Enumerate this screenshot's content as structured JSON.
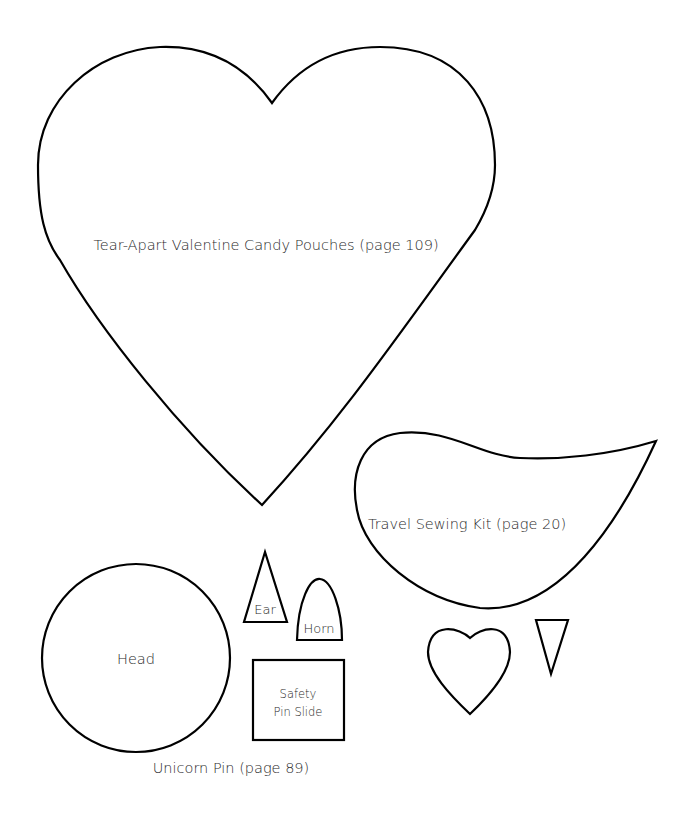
{
  "templates": {
    "big_heart": {
      "label": "Tear-Apart Valentine Candy Pouches (page 109)"
    },
    "sewing_kit": {
      "label": "Travel Sewing Kit (page 20)"
    },
    "unicorn_pin": {
      "title": "Unicorn Pin (page 89)",
      "head": "Head",
      "ear": "Ear",
      "horn": "Horn",
      "safety_pin_slide_line1": "Safety",
      "safety_pin_slide_line2": "Pin Slide"
    }
  },
  "colors": {
    "stroke": "#000000",
    "text": "#2a2a2a",
    "background": "#ffffff"
  }
}
